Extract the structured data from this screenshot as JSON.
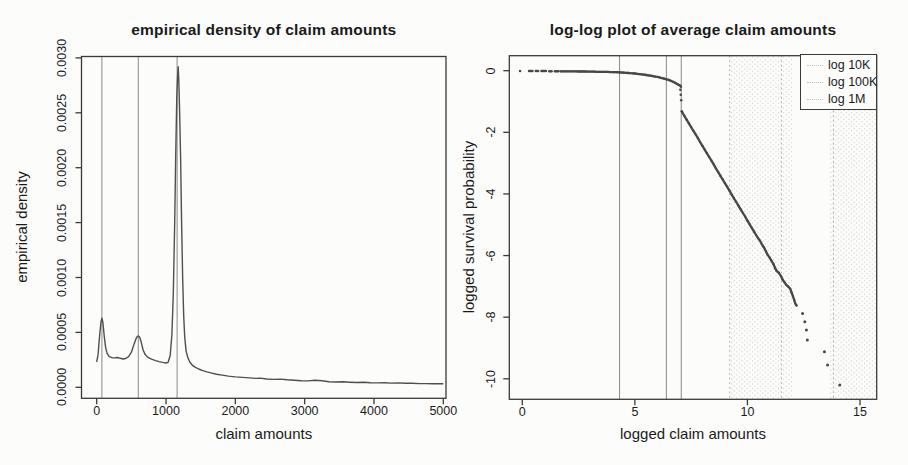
{
  "figure": {
    "background": "#fcfcfb",
    "ink_color": "#3a3a3a",
    "curve_color": "#4f4f4f",
    "point_color": "#484848",
    "solid_guide_color": "#8a8a8a",
    "dotted_guide_color": "#ababab",
    "halftone_color": "#c9c9c9"
  },
  "chart_data": [
    {
      "type": "line",
      "title": "empirical density of claim amounts",
      "xlabel": "claim amounts",
      "ylabel": "empirical density",
      "xlim": [
        0,
        5000
      ],
      "ylim": [
        0,
        0.003
      ],
      "grid": false,
      "legend_position": "none",
      "x_ticks": [
        0,
        1000,
        2000,
        3000,
        4000,
        5000
      ],
      "x_tick_labels": [
        "0",
        "1000",
        "2000",
        "3000",
        "4000",
        "5000"
      ],
      "y_ticks": [
        0,
        0.0005,
        0.001,
        0.0015,
        0.002,
        0.0025,
        0.003
      ],
      "y_tick_labels": [
        "0.0000",
        "0.0005",
        "0.0010",
        "0.0015",
        "0.0020",
        "0.0025",
        "0.0030"
      ],
      "vertical_guide_lines_x": [
        75,
        600,
        1160
      ],
      "series": [
        {
          "name": "empirical density",
          "x": [
            0,
            20,
            40,
            60,
            75,
            90,
            110,
            130,
            150,
            180,
            220,
            260,
            300,
            340,
            380,
            420,
            460,
            500,
            540,
            575,
            600,
            620,
            645,
            670,
            700,
            740,
            790,
            850,
            900,
            950,
            1000,
            1030,
            1060,
            1085,
            1105,
            1125,
            1140,
            1155,
            1165,
            1175,
            1185,
            1195,
            1210,
            1225,
            1240,
            1255,
            1270,
            1290,
            1315,
            1345,
            1380,
            1420,
            1470,
            1530,
            1590,
            1660,
            1730,
            1810,
            1900,
            2000,
            2100,
            2200,
            2300,
            2360,
            2450,
            2550,
            2650,
            2750,
            2850,
            2950,
            3050,
            3150,
            3250,
            3350,
            3450,
            3550,
            3650,
            3750,
            3850,
            3950,
            4050,
            4150,
            4250,
            4350,
            4450,
            4550,
            4650,
            4750,
            4850,
            4950,
            5000
          ],
          "y": [
            0.00023,
            0.0003,
            0.00046,
            0.00059,
            0.00063,
            0.00059,
            0.00046,
            0.00036,
            0.00031,
            0.00028,
            0.00027,
            0.000268,
            0.000271,
            0.000264,
            0.000258,
            0.000262,
            0.00028,
            0.00032,
            0.000395,
            0.000455,
            0.000468,
            0.000455,
            0.000405,
            0.00034,
            0.000298,
            0.000272,
            0.000256,
            0.000243,
            0.000234,
            0.000227,
            0.000221,
            0.000228,
            0.00029,
            0.00048,
            0.00085,
            0.0015,
            0.0021,
            0.00265,
            0.00282,
            0.00292,
            0.0028,
            0.00255,
            0.0021,
            0.0015,
            0.00098,
            0.00065,
            0.00046,
            0.00033,
            0.00027,
            0.000228,
            0.0002,
            0.000184,
            0.000167,
            0.000152,
            0.00014,
            0.000129,
            0.000119,
            0.000111,
            0.000102,
            9.5e-05,
            9e-05,
            8.6e-05,
            8.1e-05,
            8.4e-05,
            7.6e-05,
            7.2e-05,
            7.5e-05,
            6.8e-05,
            6.4e-05,
            6e-05,
            5.8e-05,
            6.5e-05,
            5.9e-05,
            5e-05,
            4.8e-05,
            5e-05,
            4.6e-05,
            4.4e-05,
            4.6e-05,
            4.2e-05,
            4e-05,
            4.2e-05,
            3.8e-05,
            4e-05,
            3.6e-05,
            3.6e-05,
            3.4e-05,
            3.4e-05,
            3.2e-05,
            3.2e-05,
            3.2e-05
          ]
        }
      ]
    },
    {
      "type": "scatter",
      "title": "log-log plot of average claim amounts",
      "xlabel": "logged claim amounts",
      "ylabel": "logged survival probability",
      "xlim": [
        -0.6,
        15.74
      ],
      "ylim": [
        -10.65,
        0.48
      ],
      "grid": false,
      "x_ticks": [
        0,
        5,
        10,
        15
      ],
      "x_tick_labels": [
        "0",
        "5",
        "10",
        "15"
      ],
      "y_ticks": [
        0,
        -2,
        -4,
        -6,
        -8,
        -10
      ],
      "y_tick_labels": [
        "0",
        "-2",
        "-4",
        "-6",
        "-8",
        "-10"
      ],
      "solid_guide_lines_x": [
        4.32,
        6.4,
        7.06
      ],
      "dotted_guide_lines_x": [
        9.21,
        11.51,
        13.82
      ],
      "halftone_bands_x": [
        [
          9.3,
          12.0
        ],
        [
          13.7,
          15.7
        ]
      ],
      "legend": {
        "position": "top-right",
        "entries": [
          "log 10K",
          "log 100K",
          "log 1M"
        ]
      },
      "series": {
        "lead_points": [
          [
            -0.1,
            -0.01
          ],
          [
            0.3,
            -0.01
          ],
          [
            0.35,
            -0.01
          ],
          [
            0.4,
            -0.01
          ],
          [
            0.45,
            -0.01
          ],
          [
            0.6,
            -0.01
          ],
          [
            0.65,
            -0.01
          ],
          [
            0.7,
            -0.01
          ],
          [
            0.85,
            -0.01
          ],
          [
            0.9,
            -0.01
          ],
          [
            0.95,
            -0.01
          ],
          [
            1.0,
            -0.01
          ],
          [
            1.05,
            -0.01
          ],
          [
            1.2,
            -0.02
          ],
          [
            1.25,
            -0.02
          ],
          [
            1.3,
            -0.02
          ],
          [
            1.45,
            -0.02
          ],
          [
            1.5,
            -0.02
          ],
          [
            1.55,
            -0.02
          ],
          [
            1.6,
            -0.02
          ]
        ],
        "flat_run": [
          [
            1.7,
            -0.02
          ],
          [
            1.8,
            -0.02
          ],
          [
            1.9,
            -0.02
          ],
          [
            2.0,
            -0.02
          ],
          [
            2.1,
            -0.02
          ],
          [
            2.2,
            -0.02
          ],
          [
            2.3,
            -0.02
          ],
          [
            2.4,
            -0.02
          ],
          [
            2.5,
            -0.025
          ],
          [
            2.6,
            -0.025
          ],
          [
            2.7,
            -0.025
          ],
          [
            2.8,
            -0.025
          ],
          [
            2.9,
            -0.03
          ],
          [
            3.0,
            -0.03
          ],
          [
            3.1,
            -0.03
          ],
          [
            3.2,
            -0.03
          ],
          [
            3.3,
            -0.035
          ],
          [
            3.4,
            -0.035
          ],
          [
            3.5,
            -0.035
          ],
          [
            3.6,
            -0.04
          ],
          [
            3.7,
            -0.04
          ],
          [
            3.8,
            -0.04
          ],
          [
            3.9,
            -0.045
          ],
          [
            4.0,
            -0.045
          ],
          [
            4.1,
            -0.05
          ],
          [
            4.2,
            -0.05
          ],
          [
            4.3,
            -0.055
          ],
          [
            4.4,
            -0.06
          ],
          [
            4.5,
            -0.065
          ],
          [
            4.6,
            -0.07
          ],
          [
            4.7,
            -0.075
          ],
          [
            4.8,
            -0.08
          ],
          [
            4.9,
            -0.085
          ],
          [
            5.0,
            -0.09
          ],
          [
            5.1,
            -0.1
          ],
          [
            5.2,
            -0.11
          ],
          [
            5.3,
            -0.12
          ],
          [
            5.4,
            -0.13
          ],
          [
            5.5,
            -0.14
          ],
          [
            5.6,
            -0.15
          ],
          [
            5.7,
            -0.16
          ],
          [
            5.8,
            -0.175
          ],
          [
            5.9,
            -0.19
          ],
          [
            6.0,
            -0.2
          ],
          [
            6.1,
            -0.22
          ],
          [
            6.2,
            -0.24
          ],
          [
            6.3,
            -0.26
          ],
          [
            6.4,
            -0.28
          ],
          [
            6.5,
            -0.3
          ],
          [
            6.6,
            -0.33
          ],
          [
            6.7,
            -0.36
          ],
          [
            6.8,
            -0.4
          ],
          [
            6.9,
            -0.44
          ],
          [
            7.0,
            -0.48
          ],
          [
            7.05,
            -0.52
          ]
        ],
        "gap_points": [
          [
            7.02,
            -0.62
          ],
          [
            7.04,
            -0.78
          ],
          [
            7.06,
            -0.96
          ]
        ],
        "steep_run": [
          [
            7.08,
            -1.32
          ],
          [
            7.1,
            -1.34
          ],
          [
            7.2,
            -1.47
          ],
          [
            7.3,
            -1.59
          ],
          [
            7.4,
            -1.71
          ],
          [
            7.5,
            -1.83
          ],
          [
            7.6,
            -1.95
          ],
          [
            7.7,
            -2.07
          ],
          [
            7.8,
            -2.19
          ],
          [
            7.9,
            -2.32
          ],
          [
            8.0,
            -2.44
          ],
          [
            8.1,
            -2.56
          ],
          [
            8.2,
            -2.68
          ],
          [
            8.3,
            -2.8
          ],
          [
            8.4,
            -2.92
          ],
          [
            8.5,
            -3.04
          ],
          [
            8.6,
            -3.17
          ],
          [
            8.7,
            -3.29
          ],
          [
            8.8,
            -3.41
          ],
          [
            8.9,
            -3.53
          ],
          [
            9.0,
            -3.65
          ],
          [
            9.1,
            -3.77
          ],
          [
            9.2,
            -3.89
          ],
          [
            9.3,
            -4.02
          ],
          [
            9.4,
            -4.14
          ],
          [
            9.5,
            -4.26
          ],
          [
            9.6,
            -4.38
          ],
          [
            9.7,
            -4.5
          ],
          [
            9.8,
            -4.62
          ],
          [
            9.9,
            -4.74
          ],
          [
            10.0,
            -4.87
          ],
          [
            10.1,
            -4.99
          ],
          [
            10.2,
            -5.11
          ],
          [
            10.3,
            -5.23
          ],
          [
            10.4,
            -5.35
          ],
          [
            10.48,
            -5.44
          ],
          [
            10.56,
            -5.52
          ],
          [
            10.66,
            -5.66
          ],
          [
            10.72,
            -5.72
          ],
          [
            10.82,
            -5.86
          ],
          [
            10.9,
            -5.98
          ],
          [
            11.0,
            -6.08
          ],
          [
            11.06,
            -6.16
          ],
          [
            11.16,
            -6.28
          ],
          [
            11.24,
            -6.42
          ],
          [
            11.3,
            -6.5
          ],
          [
            11.4,
            -6.56
          ],
          [
            11.5,
            -6.68
          ],
          [
            11.56,
            -6.78
          ],
          [
            11.64,
            -6.86
          ],
          [
            11.72,
            -6.95
          ],
          [
            11.8,
            -7.0
          ],
          [
            11.9,
            -7.08
          ],
          [
            11.96,
            -7.2
          ],
          [
            12.02,
            -7.32
          ],
          [
            12.08,
            -7.45
          ],
          [
            12.12,
            -7.55
          ],
          [
            12.18,
            -7.62
          ]
        ],
        "tail_points": [
          [
            12.45,
            -7.88
          ],
          [
            12.55,
            -8.15
          ],
          [
            12.62,
            -8.42
          ],
          [
            12.66,
            -8.74
          ],
          [
            13.42,
            -9.12
          ],
          [
            13.56,
            -9.55
          ],
          [
            14.1,
            -10.2
          ]
        ]
      }
    }
  ]
}
